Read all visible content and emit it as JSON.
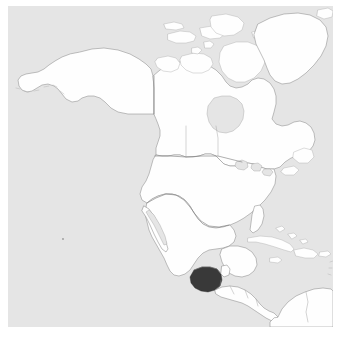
{
  "map": {
    "title": "North America locator map",
    "description": "Grayscale outline locator map of North America, Greenland and the Caribbean with one country filled dark",
    "projection_note": "Lambert conformal / conic-style North America view",
    "colors": {
      "ocean": "#e6e6e6",
      "land_fill": "#ffffff",
      "coastline": "#8e8e8e",
      "coastline_faint": "#b4b4b4",
      "internal_border": "#7a7a7a",
      "highlight_fill": "#3a3a3a",
      "page_background": "#ffffff"
    },
    "frame": {
      "image_width": 340,
      "image_height": 338,
      "canvas_left": 8,
      "canvas_top": 6,
      "canvas_width": 325,
      "canvas_height": 321
    },
    "highlight": {
      "name": "Guatemala",
      "label": "Guatemala",
      "fill": "#3a3a3a",
      "region": "Central America"
    },
    "landmasses": [
      {
        "name": "Alaska",
        "role": "land"
      },
      {
        "name": "Canada mainland",
        "role": "land"
      },
      {
        "name": "Greenland",
        "role": "land"
      },
      {
        "name": "Canadian Arctic Archipelago",
        "role": "land"
      },
      {
        "name": "Baffin Island",
        "role": "land"
      },
      {
        "name": "Victoria Island",
        "role": "land"
      },
      {
        "name": "Banks Island",
        "role": "land"
      },
      {
        "name": "Ellesmere Island",
        "role": "land"
      },
      {
        "name": "Newfoundland",
        "role": "land"
      },
      {
        "name": "Iceland",
        "role": "land"
      },
      {
        "name": "United States contiguous",
        "role": "land"
      },
      {
        "name": "Mexico",
        "role": "land"
      },
      {
        "name": "Yucatan Peninsula",
        "role": "land"
      },
      {
        "name": "Central America",
        "role": "land"
      },
      {
        "name": "Cuba",
        "role": "land"
      },
      {
        "name": "Hispaniola",
        "role": "land"
      },
      {
        "name": "Jamaica",
        "role": "land"
      },
      {
        "name": "Puerto Rico",
        "role": "land"
      },
      {
        "name": "Bahamas",
        "role": "land"
      },
      {
        "name": "Northern South America",
        "role": "land"
      }
    ],
    "internal_borders": [
      {
        "name": "Alaska - Canada border (141W meridian)"
      },
      {
        "name": "United States - Canada border (49th parallel)"
      },
      {
        "name": "United States - Mexico border"
      },
      {
        "name": "Mexico - Guatemala - Belize borders"
      },
      {
        "name": "Central American country borders"
      },
      {
        "name": "Colombia - Venezuela border"
      }
    ],
    "water_features": [
      {
        "name": "Great Lakes"
      },
      {
        "name": "Hudson Bay"
      },
      {
        "name": "Gulf of Mexico"
      },
      {
        "name": "Caribbean Sea"
      },
      {
        "name": "Pacific Ocean"
      },
      {
        "name": "Atlantic Ocean"
      }
    ]
  }
}
